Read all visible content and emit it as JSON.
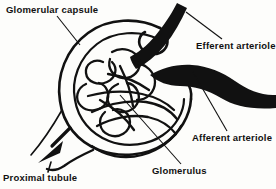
{
  "figure": {
    "type": "anatomical-line-drawing",
    "background_color": "#fdfdfb",
    "ink_color": "#111111",
    "labels": [
      {
        "id": "glomerular-capsule",
        "text": "Glomerular capsule"
      },
      {
        "id": "efferent-arteriole",
        "text": "Efferent arteriole"
      },
      {
        "id": "afferent-arteriole",
        "text": "Afferent arteriole"
      },
      {
        "id": "glomerulus",
        "text": "Glomerulus"
      },
      {
        "id": "proximal-tubule",
        "text": "Proximal tubule"
      }
    ],
    "structures": [
      {
        "id": "glomerular-capsule",
        "description": "Large C-shaped double-walled cup (Bowman's capsule) enclosing the capillary tuft"
      },
      {
        "id": "glomerulus",
        "description": "Tangled knot of capillary loops inside the capsule"
      },
      {
        "id": "afferent-arteriole",
        "description": "Thick solid black vessel entering the capsule from the right at mid height"
      },
      {
        "id": "efferent-arteriole",
        "description": "Thick solid black vessel leaving the capsule upward to the top right"
      },
      {
        "id": "proximal-tubule",
        "description": "Tubule leaving the capsule at lower left, marked with a solid flow arrow"
      }
    ],
    "flow_arrow": {
      "id": "filtrate-flow-arrow",
      "direction": "down-left",
      "description": "Solid black arrowhead showing filtrate flow into the proximal tubule"
    }
  }
}
